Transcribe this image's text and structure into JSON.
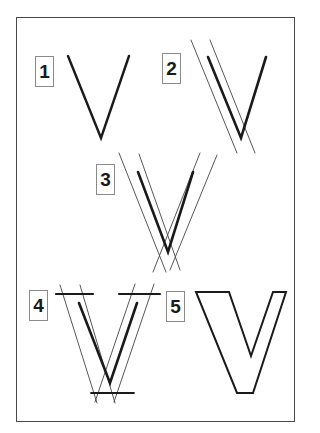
{
  "figure": {
    "frame_color": "#4a4a4a",
    "stroke_color": "#1a1a1a",
    "guide_color": "#444444",
    "steps": [
      {
        "label": "1",
        "description": "Single-stroke V skeleton"
      },
      {
        "label": "2",
        "description": "Parallel guides around thick left stroke"
      },
      {
        "label": "3",
        "description": "Parallel guides around both strokes"
      },
      {
        "label": "4",
        "description": "Guides with top and bottom serif/cap lines"
      },
      {
        "label": "5",
        "description": "Finished outlined V letterform"
      }
    ]
  }
}
